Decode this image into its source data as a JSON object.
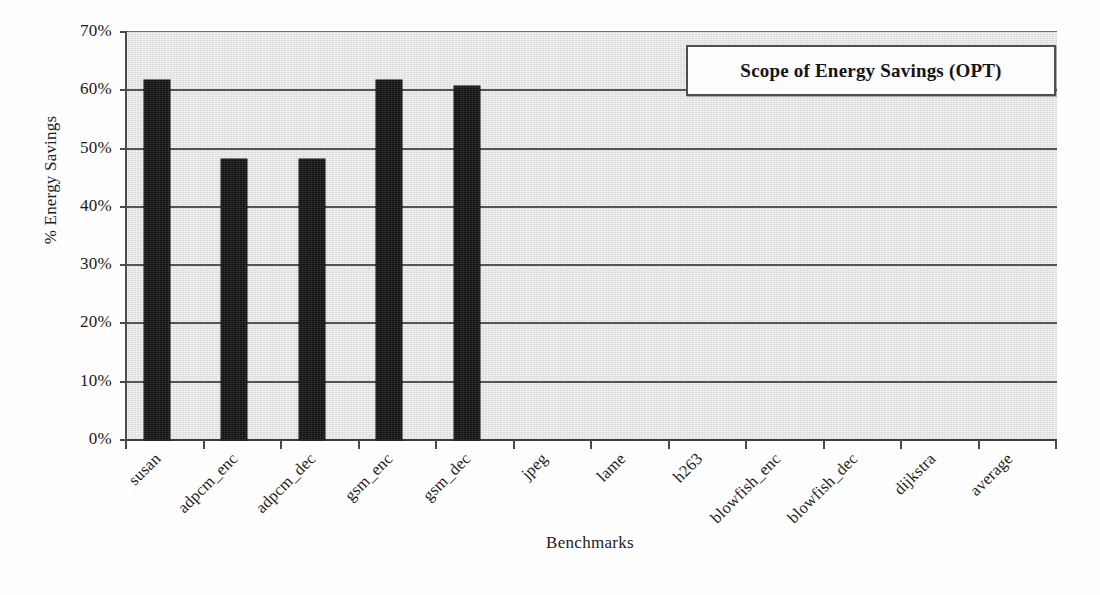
{
  "chart_data": {
    "type": "bar",
    "title": "",
    "legend": {
      "position": "top-right",
      "entries": [
        "Scope of Energy Savings (OPT)"
      ]
    },
    "xlabel": "Benchmarks",
    "ylabel": "% Energy Savings",
    "ylim": [
      0,
      70
    ],
    "ytick_values": [
      0,
      10,
      20,
      30,
      40,
      50,
      60,
      70
    ],
    "ytick_labels": [
      "0%",
      "10%",
      "20%",
      "30%",
      "40%",
      "50%",
      "60%",
      "70%"
    ],
    "grid": true,
    "grid_axis": "y",
    "bar_color": "#1c1c1c",
    "plot_background": "#e4e4e4",
    "categories": [
      "susan",
      "adpcm_enc",
      "adpcm_dec",
      "gsm_enc",
      "gsm_dec",
      "jpeg",
      "lame",
      "h263",
      "blowfish_enc",
      "blowfish_dec",
      "dijkstra",
      "average"
    ],
    "values": [
      61.8,
      48.2,
      48.2,
      61.8,
      60.7,
      0,
      0,
      0,
      0,
      0,
      0,
      0
    ],
    "series": [
      {
        "name": "Scope of Energy Savings (OPT)",
        "values": [
          61.8,
          48.2,
          48.2,
          61.8,
          60.7,
          0,
          0,
          0,
          0,
          0,
          0,
          0
        ]
      }
    ]
  },
  "axes": {
    "y_title": "% Energy Savings",
    "x_title": "Benchmarks",
    "y_ticks": [
      {
        "label": "70%",
        "value": 70
      },
      {
        "label": "60%",
        "value": 60
      },
      {
        "label": "50%",
        "value": 50
      },
      {
        "label": "40%",
        "value": 40
      },
      {
        "label": "30%",
        "value": 30
      },
      {
        "label": "20%",
        "value": 20
      },
      {
        "label": "10%",
        "value": 10
      },
      {
        "label": "0%",
        "value": 0
      }
    ],
    "x_ticks": [
      "susan",
      "adpcm_enc",
      "adpcm_dec",
      "gsm_enc",
      "gsm_dec",
      "jpeg",
      "lame",
      "h263",
      "blowfish_enc",
      "blowfish_dec",
      "dijkstra",
      "average"
    ]
  },
  "legend": {
    "label": "Scope of Energy Savings (OPT)"
  }
}
